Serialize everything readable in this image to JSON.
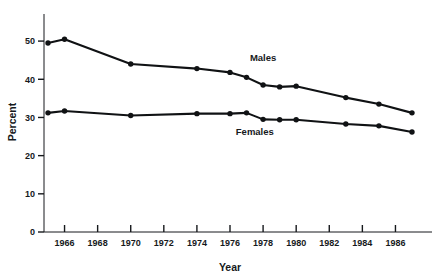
{
  "chart_data": {
    "type": "line",
    "title": "",
    "subtitle": "",
    "xlabel": "Year",
    "ylabel": "Percent",
    "xlim": [
      1965,
      1987
    ],
    "ylim": [
      0,
      55
    ],
    "grid": false,
    "legend_position": "inline-annotation",
    "x_ticks": [
      1966,
      1968,
      1970,
      1972,
      1974,
      1976,
      1978,
      1980,
      1982,
      1984,
      1986
    ],
    "x_tick_labels": [
      "1966",
      "1968",
      "1970",
      "1972",
      "1974",
      "1976",
      "1978",
      "1980",
      "1982",
      "1984",
      "1986"
    ],
    "y_ticks": [
      0,
      10,
      20,
      30,
      40,
      50
    ],
    "y_tick_labels": [
      "0",
      "10",
      "20",
      "30",
      "40",
      "50"
    ],
    "x": [
      1965,
      1966,
      1970,
      1974,
      1976,
      1977,
      1978,
      1979,
      1980,
      1983,
      1985,
      1987
    ],
    "series": [
      {
        "name": "Males",
        "label": "Males",
        "color": "#101214",
        "x": [
          1965,
          1966,
          1970,
          1974,
          1976,
          1977,
          1978,
          1979,
          1980,
          1983,
          1985,
          1987
        ],
        "values": [
          49.5,
          50.5,
          44.0,
          42.8,
          41.8,
          40.5,
          38.5,
          38.0,
          38.2,
          35.2,
          33.5,
          31.2
        ]
      },
      {
        "name": "Females",
        "label": "Females",
        "color": "#101214",
        "x": [
          1965,
          1966,
          1970,
          1974,
          1976,
          1977,
          1978,
          1979,
          1980,
          1983,
          1985,
          1987
        ],
        "values": [
          31.2,
          31.7,
          30.5,
          31.0,
          31.0,
          31.2,
          29.5,
          29.4,
          29.4,
          28.3,
          27.8,
          26.2
        ]
      }
    ],
    "annotations": [
      {
        "text": "Males",
        "x": 1978.0,
        "y": 44.8
      },
      {
        "text": "Females",
        "x": 1977.5,
        "y": 25.4
      }
    ]
  }
}
